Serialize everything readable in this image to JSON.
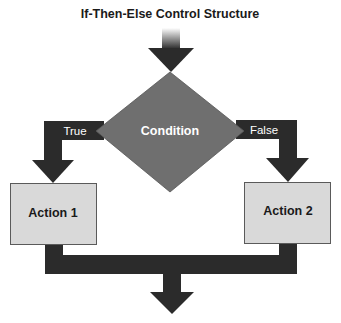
{
  "diagram": {
    "title": "If-Then-Else Control Structure",
    "decision": {
      "label": "Condition",
      "shape": "diamond"
    },
    "branches": [
      {
        "label": "True",
        "target": "Action 1"
      },
      {
        "label": "False",
        "target": "Action 2"
      }
    ],
    "actions": [
      {
        "label": "Action 1"
      },
      {
        "label": "Action 2"
      }
    ],
    "colors": {
      "arrow": "#2b2b2b",
      "diamond": "#6f6f6f",
      "box_fill": "#d9d9d9",
      "box_border": "#5a5a5a"
    }
  }
}
